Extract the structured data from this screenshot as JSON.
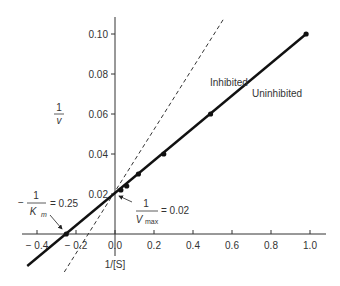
{
  "chart_data": {
    "type": "line",
    "title": "",
    "xlabel": "1/[S]",
    "ylabel": "1/v",
    "ylabel_num": "1",
    "ylabel_den": "v",
    "xlim": [
      -0.45,
      1.05
    ],
    "ylim": [
      -0.01,
      0.105
    ],
    "grid": false,
    "x_ticks": [
      -0.4,
      -0.2,
      0.0,
      0.2,
      0.4,
      0.6,
      0.8,
      1.0
    ],
    "x_tick_labels": [
      "− 0.4",
      "− 0.2",
      "0.0",
      "0.2",
      "0.4",
      "0.6",
      "0.8",
      "1.0"
    ],
    "y_ticks": [
      0.02,
      0.04,
      0.06,
      0.08,
      0.1
    ],
    "y_tick_labels": [
      "0.02",
      "0.04",
      "0.06",
      "0.08",
      "0.10"
    ],
    "series": [
      {
        "name": "Uninhibited",
        "style": "solid",
        "line": {
          "x": [
            -0.45,
            0.98
          ],
          "y": [
            -0.016,
            0.1
          ]
        },
        "points": {
          "x": [
            -0.25,
            0.03,
            0.06,
            0.12,
            0.25,
            0.49,
            0.98
          ],
          "y": [
            0.0,
            0.022,
            0.024,
            0.03,
            0.04,
            0.06,
            0.1
          ]
        }
      },
      {
        "name": "Inhibited",
        "style": "dashed",
        "line": {
          "x": [
            -0.26,
            0.56
          ],
          "y": [
            -0.019,
            0.108
          ]
        }
      }
    ],
    "annotations": [
      {
        "text_num": "1",
        "text_den": "K",
        "text_den_sub": "m",
        "prefix": "−",
        "value": "= 0.25",
        "points_to": [
          -0.25,
          0.0
        ]
      },
      {
        "text_num": "1",
        "text_den": "V",
        "text_den_sub": "max",
        "value": "= 0.02",
        "points_to": [
          0.0,
          0.02
        ]
      }
    ]
  }
}
